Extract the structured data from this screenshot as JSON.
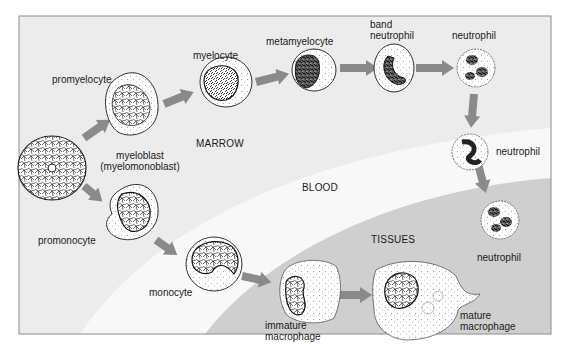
{
  "diagram": {
    "colors": {
      "marrow": "#ececec",
      "blood": "#f8f8f8",
      "tissues": "#cfcfcf",
      "arrow": "#8a8a8a",
      "frame": "#8c8c8c",
      "cell_outline": "#222222"
    },
    "regions": [
      {
        "id": "marrow",
        "label": "MARROW"
      },
      {
        "id": "blood",
        "label": "BLOOD"
      },
      {
        "id": "tissues",
        "label": "TISSUES"
      }
    ],
    "cells": [
      {
        "id": "myeloblast",
        "label_line1": "myeloblast",
        "label_line2": "(myelomonoblast)"
      },
      {
        "id": "promyelocyte",
        "label": "promyelocyte"
      },
      {
        "id": "myelocyte",
        "label": "myelocyte"
      },
      {
        "id": "metamyelocyte",
        "label": "metamyelocyte"
      },
      {
        "id": "band-neutrophil",
        "label_line1": "band",
        "label_line2": "neutrophil"
      },
      {
        "id": "neutrophil-marrow",
        "label": "neutrophil"
      },
      {
        "id": "neutrophil-blood",
        "label": "neutrophil"
      },
      {
        "id": "neutrophil-tissue",
        "label": "neutrophil"
      },
      {
        "id": "promonocyte",
        "label": "promonocyte"
      },
      {
        "id": "monocyte",
        "label": "monocyte"
      },
      {
        "id": "immature-macrophage",
        "label_line1": "immature",
        "label_line2": "macrophage"
      },
      {
        "id": "mature-macrophage",
        "label_line1": "mature",
        "label_line2": "macrophage"
      }
    ],
    "arrows": [
      {
        "from": "myeloblast",
        "to": "promyelocyte"
      },
      {
        "from": "promyelocyte",
        "to": "myelocyte"
      },
      {
        "from": "myelocyte",
        "to": "metamyelocyte"
      },
      {
        "from": "metamyelocyte",
        "to": "band-neutrophil"
      },
      {
        "from": "band-neutrophil",
        "to": "neutrophil-marrow"
      },
      {
        "from": "neutrophil-marrow",
        "to": "neutrophil-blood"
      },
      {
        "from": "neutrophil-blood",
        "to": "neutrophil-tissue"
      },
      {
        "from": "myeloblast",
        "to": "promonocyte"
      },
      {
        "from": "promonocyte",
        "to": "monocyte"
      },
      {
        "from": "monocyte",
        "to": "immature-macrophage"
      },
      {
        "from": "immature-macrophage",
        "to": "mature-macrophage"
      }
    ]
  }
}
